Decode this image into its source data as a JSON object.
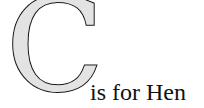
{
  "letter": "C",
  "caption": "is for Hen",
  "colors": {
    "letter_fill": "#e3e3e3",
    "letter_outline": "#111111",
    "text": "#111111",
    "background": "#ffffff"
  }
}
